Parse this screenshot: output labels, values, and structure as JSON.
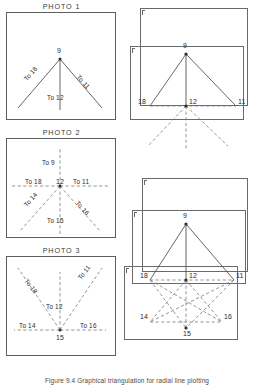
{
  "figure": {
    "caption": "Figure 9.4  Graphical triangulation for radial line plotting",
    "station_dot": "station-point"
  },
  "photos": [
    {
      "title": "PHOTO 1",
      "vertex": "9",
      "rays": [
        {
          "id": "p1-to18",
          "label": "To 18"
        },
        {
          "id": "p1-to12",
          "label": "To 12"
        },
        {
          "id": "p1-to11",
          "label": "To 11"
        }
      ]
    },
    {
      "title": "PHOTO 2",
      "vertex": "12",
      "rays": [
        {
          "id": "p2-to9",
          "label": "To 9"
        },
        {
          "id": "p2-to18",
          "label": "To 18"
        },
        {
          "id": "p2-to11",
          "label": "To 11"
        },
        {
          "id": "p2-to14",
          "label": "To 14"
        },
        {
          "id": "p2-to15",
          "label": "To 15"
        },
        {
          "id": "p2-to16",
          "label": "To 16"
        }
      ]
    },
    {
      "title": "PHOTO 3",
      "vertex": "15",
      "rays": [
        {
          "id": "p3-to18",
          "label": "To 18"
        },
        {
          "id": "p3-to12",
          "label": "To 12"
        },
        {
          "id": "p3-to11",
          "label": "To 11"
        },
        {
          "id": "p3-to14",
          "label": "To 14"
        },
        {
          "id": "p3-to16",
          "label": "To 16"
        }
      ]
    }
  ],
  "assemblies": [
    {
      "name": "assembly-upper",
      "points": [
        {
          "id": "a1-9",
          "label": "9"
        },
        {
          "id": "a1-18",
          "label": "18"
        },
        {
          "id": "a1-12",
          "label": "12"
        },
        {
          "id": "a1-11",
          "label": "11"
        }
      ]
    },
    {
      "name": "assembly-lower",
      "points": [
        {
          "id": "a2-9",
          "label": "9"
        },
        {
          "id": "a2-18",
          "label": "18"
        },
        {
          "id": "a2-12",
          "label": "12"
        },
        {
          "id": "a2-11",
          "label": "11"
        },
        {
          "id": "a2-14",
          "label": "14"
        },
        {
          "id": "a2-15",
          "label": "15"
        },
        {
          "id": "a2-16",
          "label": "16"
        }
      ]
    }
  ],
  "colors": {
    "solid_line": "#4a4a4a",
    "dashed_line": "#7a7a7a",
    "frame": "#5d5d5d",
    "text": "#2a2a2a"
  }
}
